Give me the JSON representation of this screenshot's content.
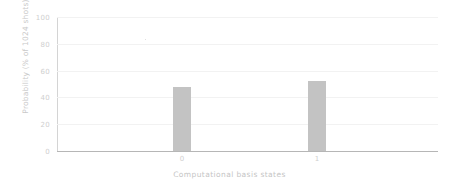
{
  "chart_data": {
    "type": "bar",
    "title": "",
    "subtitle": "",
    "xlabel": "Computational basis states",
    "ylabel": "Probability (% of 1024 shots)",
    "categories": [
      "0",
      "1"
    ],
    "values": [
      48,
      52
    ],
    "series": [
      {
        "name": "Probability",
        "values": [
          48,
          52
        ],
        "color": "#c3c3c3"
      }
    ],
    "ylim": [
      0,
      100
    ],
    "yticks": [
      0,
      20,
      40,
      60,
      80,
      100
    ],
    "ytick_labels": [
      "0",
      "20",
      "40",
      "60",
      "80",
      "100"
    ],
    "xtick_labels": [
      "0",
      "1"
    ],
    "grid": true,
    "grid_axis": "y",
    "legend": false,
    "legend_position": "none",
    "bar_color": "#c3c3c3",
    "axis_color": "#b6b6b6",
    "grid_color": "#f2f2f2",
    "text_color": "#cfcfcf",
    "background": "#ffffff"
  }
}
